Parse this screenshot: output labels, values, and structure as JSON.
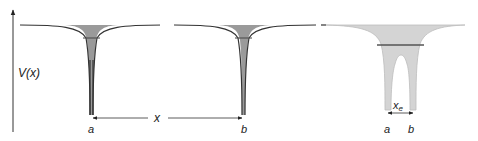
{
  "axis": {
    "ylabel": "V(x)"
  },
  "panels": [
    {
      "id": "well-a",
      "label": "a"
    },
    {
      "id": "well-b",
      "label": "b"
    },
    {
      "id": "double-well",
      "labels": [
        "a",
        "b"
      ],
      "separation_label": "x",
      "separation_subscript": "e"
    }
  ],
  "separation": {
    "label": "x"
  },
  "colors": {
    "well_fill_dark": "#9a9a9a",
    "well_fill_light": "#d4d4d4",
    "outline": "#333333",
    "level_line": "#555555"
  }
}
